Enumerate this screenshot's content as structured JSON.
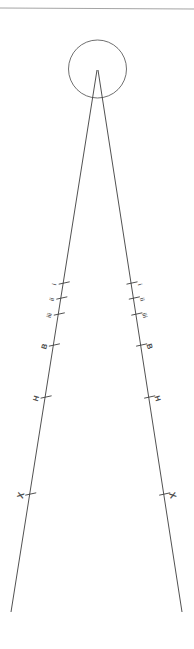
{
  "figure": {
    "background_color": "#ffffff",
    "width": 194,
    "height": 649,
    "line_color": "#3d3d3d",
    "circle_color": "#555555",
    "rule_color": "#9a9a9a",
    "label_color": "#4d4d4d"
  },
  "header_rule": {
    "name": "top-horizontal-rule",
    "x1": 0,
    "y1": 8,
    "x2": 194,
    "y2": 9
  },
  "sun": {
    "name": "sun-circle",
    "cx": 97.5,
    "cy": 69,
    "r": 29
  },
  "vanishing_point": {
    "x": 97,
    "y": 70
  },
  "rails": [
    {
      "name": "left-rail",
      "x1": 97,
      "y1": 70,
      "x2": 11,
      "y2": 612
    },
    {
      "name": "right-rail",
      "x1": 98,
      "y1": 70,
      "x2": 182,
      "y2": 612
    }
  ],
  "left_marks": [
    {
      "label": "i",
      "y": 283,
      "size": "sm",
      "rotation": -74
    },
    {
      "label": "ii",
      "y": 298,
      "size": "sm",
      "rotation": -74
    },
    {
      "label": "iii",
      "y": 314,
      "size": "sm",
      "rotation": -74
    },
    {
      "label": "B",
      "y": 345,
      "size": "md",
      "rotation": -74
    },
    {
      "label": "H",
      "y": 397,
      "size": "md",
      "rotation": -74
    },
    {
      "label": "X",
      "y": 494,
      "size": "lg",
      "rotation": -74
    }
  ],
  "right_marks": [
    {
      "label": "i",
      "y": 283,
      "size": "sm",
      "rotation": 74
    },
    {
      "label": "ii",
      "y": 298,
      "size": "sm",
      "rotation": 74
    },
    {
      "label": "iii",
      "y": 314,
      "size": "sm",
      "rotation": 74
    },
    {
      "label": "B",
      "y": 345,
      "size": "md",
      "rotation": 74
    },
    {
      "label": "H",
      "y": 397,
      "size": "md",
      "rotation": 74
    },
    {
      "label": "X",
      "y": 494,
      "size": "lg",
      "rotation": 74
    }
  ]
}
